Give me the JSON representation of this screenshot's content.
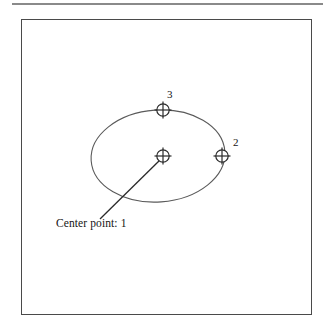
{
  "figure": {
    "caption": "Center point: 1",
    "frame": {
      "stroke_color": "#4a4a4a",
      "background_color": "#ffffff"
    },
    "page_rule": {
      "color": "#8a8a8a"
    },
    "geometry": {
      "shape": "ellipse",
      "stroke_color": "#5a5a5a",
      "center_x": 158,
      "center_y": 156,
      "radius_x": 67,
      "radius_y": 46,
      "rotation_degrees": -4
    },
    "points": [
      {
        "id": "1",
        "label": "Center point: 1",
        "role": "center-point",
        "x": 163,
        "y": 156,
        "marker": "crosshair-circle"
      },
      {
        "id": "2",
        "label": "2",
        "role": "axis-endpoint",
        "x": 222,
        "y": 156,
        "marker": "crosshair-circle"
      },
      {
        "id": "3",
        "label": "3",
        "role": "axis-endpoint",
        "x": 163,
        "y": 110,
        "marker": "crosshair-circle"
      }
    ],
    "leader_line": {
      "from_x": 161,
      "from_y": 159,
      "to_x": 100,
      "to_y": 219,
      "stroke_color": "#2a2a2a"
    }
  }
}
